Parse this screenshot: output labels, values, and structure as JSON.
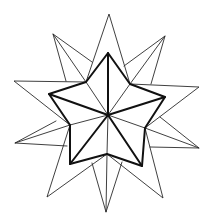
{
  "figure": {
    "background": "#ffffff",
    "stroke_color": "#111111",
    "center": [
      108,
      115
    ],
    "inner_star": {
      "tips": [
        [
          108,
          53
        ],
        [
          165,
          97
        ],
        [
          142,
          166
        ],
        [
          70,
          164
        ],
        [
          49,
          94
        ]
      ],
      "valleys": [
        [
          130,
          84
        ],
        [
          145,
          128
        ],
        [
          107,
          154
        ],
        [
          70,
          125
        ],
        [
          86,
          82
        ]
      ]
    },
    "outer_star": {
      "tips": [
        [
          109,
          14
        ],
        [
          165,
          36
        ],
        [
          199,
          87
        ],
        [
          199,
          148
        ],
        [
          163,
          198
        ],
        [
          106,
          212
        ],
        [
          47,
          197
        ],
        [
          15,
          143
        ],
        [
          14,
          81
        ],
        [
          53,
          34
        ]
      ]
    }
  }
}
